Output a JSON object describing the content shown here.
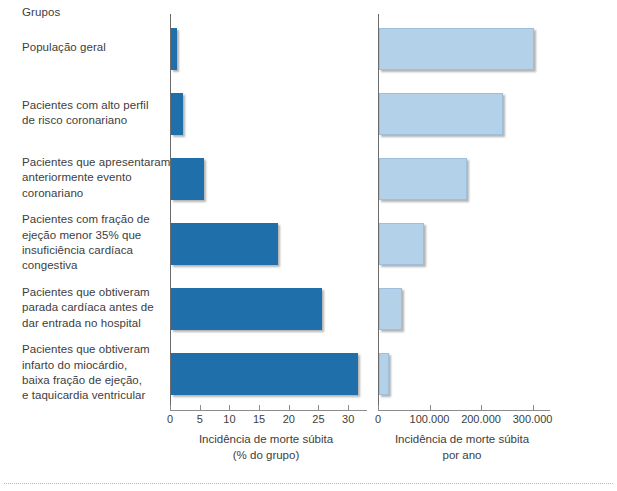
{
  "header": {
    "groups_title": "Grupos"
  },
  "chart_data": {
    "type": "bar",
    "title": "",
    "orientation": "horizontal",
    "grid": false,
    "legend": null,
    "categories": [
      "População geral",
      "Pacientes com alto perfil de risco coronariano",
      "Pacientes que apresentaram anteriormente evento coronariano",
      "Pacientes com fração de ejeção menor 35% que insuficiência cardíaca congestiva",
      "Pacientes que obtiveram parada cardíaca antes de dar entrada no hospital",
      "Pacientes que obtiveram infarto do miocárdio, baixa fração de ejeção, e taquicardia ventricular"
    ],
    "category_lines": [
      [
        "População geral"
      ],
      [
        "Pacientes com alto perfil",
        "de risco coronariano"
      ],
      [
        "Pacientes que apresentaram",
        "anteriormente evento",
        "coronariano"
      ],
      [
        "Pacientes com fração de",
        "ejeção menor 35% que",
        "insuficiência cardíaca",
        "congestiva"
      ],
      [
        "Pacientes que obtiveram",
        "parada cardíaca antes de",
        "dar entrada no hospital"
      ],
      [
        "Pacientes que obtiveram",
        "infarto do miocárdio,",
        "baixa fração de ejeção,",
        "e taquicardia ventricular"
      ]
    ],
    "panels": [
      {
        "name": "percent",
        "values": [
          1,
          2,
          5.5,
          18,
          25.5,
          31.5
        ],
        "xlabel_lines": [
          "Incidência de morte súbita",
          "(% do grupo)"
        ],
        "xlim": [
          0,
          33
        ],
        "ticks": [
          0,
          5,
          10,
          15,
          20,
          25,
          30
        ],
        "tick_labels": [
          "0",
          "5",
          "10",
          "15",
          "20",
          "25",
          "30"
        ],
        "color": "#1f6fab"
      },
      {
        "name": "per-year",
        "values": [
          300000,
          240000,
          170000,
          87000,
          45000,
          20000
        ],
        "xlabel_lines": [
          "Incidência de morte súbita",
          "por ano"
        ],
        "xlim": [
          0,
          330000
        ],
        "ticks": [
          0,
          100000,
          200000,
          300000
        ],
        "tick_labels": [
          "0",
          "100.000",
          "200.000",
          "300.000"
        ],
        "color": "#b3d2ea"
      }
    ]
  }
}
